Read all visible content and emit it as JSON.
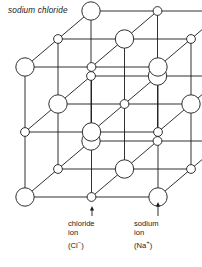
{
  "figure": {
    "title": "sodium chloride",
    "diagram_type": "crystal-lattice",
    "colors": {
      "line": "#1a1a1a",
      "node_fill": "#ffffff",
      "text": "#1a1a1a",
      "background": "#ffffff"
    }
  },
  "lattice": {
    "grid": {
      "nx": 3,
      "ny": 3,
      "nz": 3
    },
    "origin": {
      "x": 25,
      "y": 197
    },
    "step_x": 66.5,
    "step_y": -65,
    "depth_dx": 33,
    "depth_dy": -28,
    "ion_types": [
      {
        "name": "chloride",
        "symbol": "Cl",
        "charge": "-",
        "radius": 9.2,
        "parity": 0,
        "label": "chloride ion (Cl-)"
      },
      {
        "name": "sodium",
        "symbol": "Na",
        "charge": "+",
        "radius": 4.4,
        "parity": 1,
        "label": "sodium ion (Na+)"
      }
    ]
  },
  "callouts": [
    {
      "id": "chloride",
      "line1": "chloride",
      "line2": "ion",
      "line3_prefix": "(Cl",
      "line3_sup": "−",
      "line3_suffix": ")",
      "arrow_x": 92,
      "arrow_top": 206,
      "arrow_bottom": 216
    },
    {
      "id": "sodium",
      "line1": "sodium",
      "line2": "ion",
      "line3_prefix": "(Na",
      "line3_sup": "+",
      "line3_suffix": ")",
      "arrow_x": 158,
      "arrow_top": 202,
      "arrow_bottom": 216
    }
  ]
}
